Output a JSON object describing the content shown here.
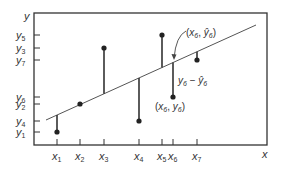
{
  "diagram": {
    "title": "",
    "colors": {
      "stroke": "#333333",
      "line": "#555555",
      "point": "#222222",
      "text": "#333333"
    },
    "axes": {
      "x_label": "x",
      "y_label": "y",
      "x_ticks": [
        {
          "label": "x",
          "sub": "1",
          "px": 57
        },
        {
          "label": "x",
          "sub": "2",
          "px": 80
        },
        {
          "label": "x",
          "sub": "3",
          "px": 104
        },
        {
          "label": "x",
          "sub": "4",
          "px": 139
        },
        {
          "label": "x",
          "sub": "5",
          "px": 162
        },
        {
          "label": "x",
          "sub": "6",
          "px": 173
        },
        {
          "label": "x",
          "sub": "7",
          "px": 197
        }
      ],
      "y_ticks": [
        {
          "label": "y",
          "sub": "5",
          "py": 35
        },
        {
          "label": "y",
          "sub": "3",
          "py": 48
        },
        {
          "label": "y",
          "sub": "7",
          "py": 60
        },
        {
          "label": "y",
          "sub": "6",
          "py": 97
        },
        {
          "label": "y",
          "sub": "2",
          "py": 104
        },
        {
          "label": "y",
          "sub": "4",
          "py": 121
        },
        {
          "label": "y",
          "sub": "1",
          "py": 132
        }
      ]
    },
    "regression_line": {
      "x1": 46,
      "y1": 120,
      "x2": 256,
      "y2": 25
    },
    "points": [
      {
        "name": "point-1",
        "px": 57,
        "py": 132
      },
      {
        "name": "point-2",
        "px": 80,
        "py": 104
      },
      {
        "name": "point-3",
        "px": 104,
        "py": 48
      },
      {
        "name": "point-4",
        "px": 139,
        "py": 121
      },
      {
        "name": "point-5",
        "px": 162,
        "py": 35
      },
      {
        "name": "point-6",
        "px": 173,
        "py": 97
      },
      {
        "name": "point-7",
        "px": 197,
        "py": 60
      }
    ],
    "annotations": {
      "fitted_point_label": "(x6, ŷ6)",
      "fitted_point_parts": {
        "open": "(",
        "x": "x",
        "xsub": "6",
        "comma": ", ",
        "y": "ŷ",
        "ysub": "6",
        "close": ")"
      },
      "residual_label": "y6 − ŷ6",
      "residual_parts": {
        "y": "y",
        "ysub": "6",
        "minus": " − ",
        "yhat": "ŷ",
        "yhatsub": "6"
      },
      "observed_point_label": "(x6, y6)",
      "observed_point_parts": {
        "open": "(",
        "x": "x",
        "xsub": "6",
        "comma": ", ",
        "y": "y",
        "ysub": "6",
        "close": ")"
      }
    }
  }
}
